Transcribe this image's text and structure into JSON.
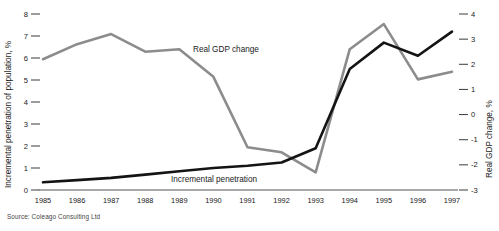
{
  "source_note": "Source: Coleago Consulting Ltd",
  "labels": {
    "left_axis_title": "Incremental penetration of population, %",
    "right_axis_title": "Real GDP change, %",
    "gdp_series_label": "Real GDP change",
    "penetration_series_label": "Incremental penetration"
  },
  "colors": {
    "gdp_line": "#8c8c8c",
    "penetration_line": "#141414",
    "axis_text": "#1a1a1a",
    "background": "#ffffff",
    "source_text": "#444444"
  },
  "chart_data": {
    "type": "line",
    "title": "",
    "xlabel": "",
    "grid": false,
    "legend": "inline-annotations",
    "categories": [
      "1985",
      "1986",
      "1987",
      "1988",
      "1989",
      "1990",
      "1991",
      "1992",
      "1993",
      "1994",
      "1995",
      "1996",
      "1997"
    ],
    "axes": {
      "left": {
        "label": "Incremental penetration of population, %",
        "ticks": [
          0,
          1,
          2,
          3,
          4,
          5,
          6,
          7,
          8
        ],
        "range": [
          0,
          8
        ]
      },
      "right": {
        "label": "Real GDP change, %",
        "ticks": [
          -3,
          -2,
          -1,
          0,
          1,
          2,
          3,
          4
        ],
        "range": [
          -3,
          4
        ]
      }
    },
    "series": [
      {
        "name": "Real GDP change",
        "axis": "right",
        "color": "#8c8c8c",
        "values": [
          2.2,
          2.8,
          3.2,
          2.5,
          2.6,
          1.5,
          -1.3,
          -1.5,
          -2.3,
          2.6,
          3.6,
          1.4,
          1.7
        ]
      },
      {
        "name": "Incremental penetration",
        "axis": "left",
        "color": "#141414",
        "values": [
          0.35,
          0.45,
          0.55,
          0.7,
          0.85,
          1.0,
          1.1,
          1.25,
          1.9,
          5.5,
          6.7,
          6.1,
          7.2
        ]
      }
    ],
    "tick_labels": {
      "left": [
        "0",
        "1",
        "2",
        "3",
        "4",
        "5",
        "6",
        "7",
        "8"
      ],
      "right": [
        "-3",
        "-2",
        "-1",
        "0",
        "1",
        "2",
        "3",
        "4"
      ],
      "x": [
        "1985",
        "1986",
        "1987",
        "1988",
        "1989",
        "1990",
        "1991",
        "1992",
        "1993",
        "1994",
        "1995",
        "1996",
        "1997"
      ]
    }
  }
}
